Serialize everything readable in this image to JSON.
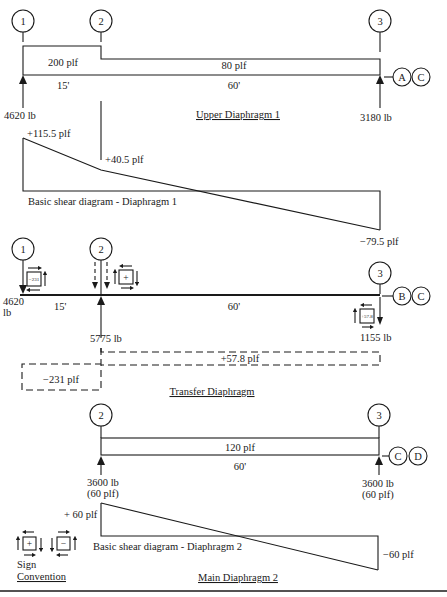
{
  "upper_diaphragm": {
    "title": "Upper Diaphragm 1",
    "gridlines": [
      "1",
      "2",
      "3"
    ],
    "line_labels": [
      "A",
      "C"
    ],
    "load_left": "200 plf",
    "load_right": "80 plf",
    "span_left": "15'",
    "span_right": "60'",
    "reaction_left": "4620 lb",
    "reaction_right": "3180 lb"
  },
  "shear_diagram_1": {
    "title": "Basic shear diagram - Diaphragm 1",
    "value_start": "+115.5 plf",
    "value_mid": "+40.5 plf",
    "value_end": "−79.5 plf"
  },
  "transfer_diaphragm": {
    "title": "Transfer Diaphragm",
    "gridlines": [
      "1",
      "2",
      "3"
    ],
    "line_labels": [
      "B",
      "C"
    ],
    "span_left": "15'",
    "span_right": "60'",
    "reaction_left_value": "4620",
    "reaction_left_unit": "lb",
    "reaction_mid": "5775 lb",
    "reaction_right": "1155 lb",
    "shear_left": "−231 plf",
    "shear_right": "+57.8 plf",
    "element_left_sign": "−231",
    "element_mid_sign": "+",
    "element_right_sign": "+57.8"
  },
  "main_diaphragm": {
    "title": "Main Diaphragm 2",
    "gridlines": [
      "2",
      "3"
    ],
    "line_labels": [
      "C",
      "D"
    ],
    "load": "120 plf",
    "span": "60'",
    "reaction_left": "3600 lb",
    "reaction_left_sub": "(60 plf)",
    "reaction_right": "3600 lb",
    "reaction_right_sub": "(60 plf)"
  },
  "shear_diagram_2": {
    "title": "Basic shear diagram - Diaphragm 2",
    "value_start": "+ 60 plf",
    "value_end": "−60 plf"
  },
  "sign_convention": {
    "line1": "Sign",
    "line2": "Convention",
    "positive": "+",
    "negative": "−"
  },
  "colors": {
    "ink": "#1a1a1a",
    "background": "#ffffff"
  }
}
